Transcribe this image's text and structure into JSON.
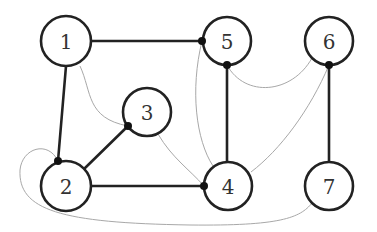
{
  "diagram": {
    "type": "graph",
    "nodes": [
      {
        "id": "1",
        "label": "1",
        "cx": 66,
        "cy": 41
      },
      {
        "id": "2",
        "label": "2",
        "cx": 66,
        "cy": 186
      },
      {
        "id": "3",
        "label": "3",
        "cx": 147,
        "cy": 112
      },
      {
        "id": "4",
        "label": "4",
        "cx": 228,
        "cy": 186
      },
      {
        "id": "5",
        "label": "5",
        "cx": 227,
        "cy": 41
      },
      {
        "id": "6",
        "label": "6",
        "cx": 329,
        "cy": 41
      },
      {
        "id": "7",
        "label": "7",
        "cx": 329,
        "cy": 186
      }
    ],
    "thick_edges": [
      [
        "1",
        "5"
      ],
      [
        "1",
        "2"
      ],
      [
        "2",
        "3"
      ],
      [
        "2",
        "4"
      ],
      [
        "5",
        "4"
      ],
      [
        "6",
        "7"
      ]
    ],
    "thin_curved_edges": [
      [
        "1",
        "3"
      ],
      [
        "3",
        "4"
      ],
      [
        "5",
        "4"
      ],
      [
        "5",
        "6"
      ],
      [
        "6",
        "4"
      ],
      [
        "2",
        "7"
      ]
    ],
    "junction_dots": [
      {
        "at": "node-5-left",
        "x": 202,
        "y": 41
      },
      {
        "at": "node-5-bottom",
        "x": 227,
        "y": 65
      },
      {
        "at": "node-6-bottom",
        "x": 329,
        "y": 65
      },
      {
        "at": "node-3-lower-left",
        "x": 128,
        "y": 126
      },
      {
        "at": "node-2-top",
        "x": 58,
        "y": 161
      },
      {
        "at": "node-4-left",
        "x": 204,
        "y": 186
      }
    ]
  }
}
